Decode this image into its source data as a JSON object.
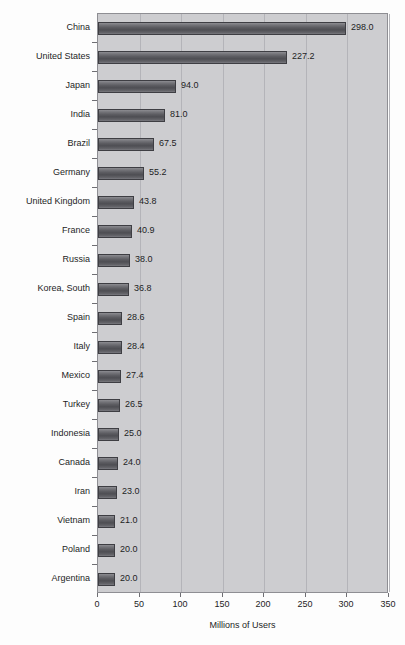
{
  "chart_data": {
    "type": "bar",
    "orientation": "horizontal",
    "title": "",
    "xlabel": "Millions of Users",
    "ylabel": "",
    "xlim": [
      0,
      350
    ],
    "xticks": [
      0,
      50,
      100,
      150,
      200,
      250,
      300,
      350
    ],
    "grid": "vertical",
    "legend": null,
    "categories": [
      "China",
      "United States",
      "Japan",
      "India",
      "Brazil",
      "Germany",
      "United Kingdom",
      "France",
      "Russia",
      "Korea, South",
      "Spain",
      "Italy",
      "Mexico",
      "Turkey",
      "Indonesia",
      "Canada",
      "Iran",
      "Vietnam",
      "Poland",
      "Argentina"
    ],
    "values": [
      298.0,
      227.2,
      94.0,
      81.0,
      67.5,
      55.2,
      43.8,
      40.9,
      38.0,
      36.8,
      28.6,
      28.4,
      27.4,
      26.5,
      25.0,
      24.0,
      23.0,
      21.0,
      20.0,
      20.0
    ],
    "value_labels": [
      "298.0",
      "227.2",
      "94.0",
      "81.0",
      "67.5",
      "55.2",
      "43.8",
      "40.9",
      "38.0",
      "36.8",
      "28.6",
      "28.4",
      "27.4",
      "26.5",
      "25.0",
      "24.0",
      "23.0",
      "21.0",
      "20.0",
      "20.0"
    ],
    "colors": {
      "plot_background": "#cdcdd0",
      "figure_background": "#fdfdfd",
      "bar_fill": "#5b5b60",
      "bar_edge": "#3e3e43",
      "gridline": "#b4b4b9",
      "axis": "#8e8e93",
      "text": "#1d1d1f"
    }
  }
}
